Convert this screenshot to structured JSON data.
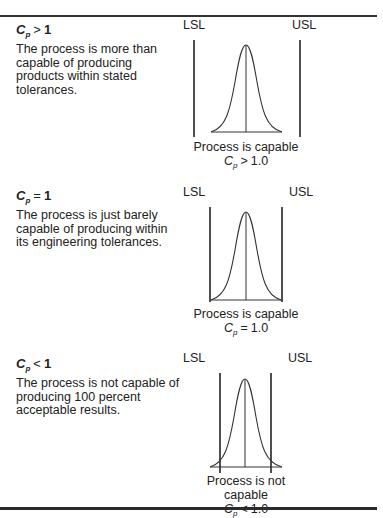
{
  "cases": [
    {
      "id": "greater",
      "title": {
        "symbol": "C",
        "subscript": "p",
        "operator": ">",
        "value": "1"
      },
      "description": "The process is more than capable of producing products within stated tolerances.",
      "lsl_label": "LSL",
      "usl_label": "USL",
      "caption": "Process is capable",
      "caption_formula": {
        "symbol": "C",
        "subscript": "p",
        "operator": ">",
        "value": "1.0"
      },
      "geometry": {
        "lsl_x": 194,
        "usl_x": 300,
        "limit_top": 40,
        "limit_bottom": 137,
        "curve_left": 211,
        "curve_right": 282,
        "peak_x": 246,
        "peak_y": 45,
        "baseline_y": 132
      }
    },
    {
      "id": "equal",
      "title": {
        "symbol": "C",
        "subscript": "p",
        "operator": "=",
        "value": "1"
      },
      "description": "The process is just barely capable of producing within its engineering tolerances.",
      "lsl_label": "LSL",
      "usl_label": "USL",
      "caption": "Process is capable",
      "caption_formula": {
        "symbol": "C",
        "subscript": "p",
        "operator": "=",
        "value": "1.0"
      },
      "geometry": {
        "lsl_x": 210,
        "usl_x": 282,
        "limit_top": 207,
        "limit_bottom": 302,
        "curve_left": 211,
        "curve_right": 281,
        "peak_x": 246,
        "peak_y": 212,
        "baseline_y": 300
      }
    },
    {
      "id": "less",
      "title": {
        "symbol": "C",
        "subscript": "p",
        "operator": "<",
        "value": "1"
      },
      "description": "The process is not capable of producing 100 percent acceptable results.",
      "lsl_label": "LSL",
      "usl_label": "USL",
      "caption": "Process is not capable",
      "caption_formula": {
        "symbol": "C",
        "subscript": "p",
        "operator": "<",
        "value": "1.0"
      },
      "geometry": {
        "lsl_x": 220,
        "usl_x": 271,
        "limit_top": 373,
        "limit_bottom": 473,
        "curve_left": 210,
        "curve_right": 282,
        "peak_x": 245,
        "peak_y": 379,
        "baseline_y": 467
      }
    }
  ],
  "colors": {
    "line": "#222222",
    "curve": "#444444",
    "text": "#222222"
  }
}
